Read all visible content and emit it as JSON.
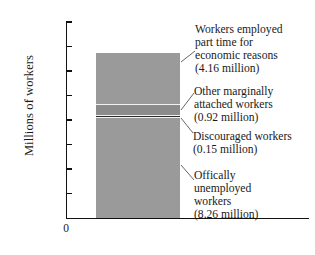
{
  "chart_data": {
    "type": "bar",
    "subtype": "stacked-single-bar",
    "title": "",
    "xlabel": "",
    "ylabel": "Millions of workers",
    "ylim": [
      0,
      16
    ],
    "yticks": [
      16,
      14,
      12,
      10,
      8,
      6,
      4,
      2
    ],
    "ytick_labels": [
      "16",
      "14",
      "12",
      "10",
      "8",
      "6",
      "4",
      "2"
    ],
    "origin_label": "0",
    "grid": false,
    "legend": false,
    "categories": [
      ""
    ],
    "total": 13.49,
    "units": "millions of workers",
    "series": [
      {
        "name": "Offically unemployed workers",
        "values": [
          8.26
        ],
        "value_label": "(8.26 million)",
        "color": "#9a9a9a",
        "order_from_bottom": 1
      },
      {
        "name": "Discouraged workers",
        "values": [
          0.15
        ],
        "value_label": "(0.15 million)",
        "color": "#2b2b2b",
        "order_from_bottom": 2
      },
      {
        "name": "Other marginally attached workers",
        "values": [
          0.92
        ],
        "value_label": "(0.92 million)",
        "color": "#8b8b8b",
        "order_from_bottom": 3
      },
      {
        "name": "Workers employed part time for economic reasons",
        "values": [
          4.16
        ],
        "value_label": "(4.16 million)",
        "color": "#9a9a9a",
        "order_from_bottom": 4
      }
    ],
    "annotations": [
      {
        "id": "part-time",
        "lines": [
          "Workers employed",
          "part time for",
          "economic reasons",
          "(4.16 million)"
        ]
      },
      {
        "id": "marginally-attached",
        "lines": [
          "Other marginally",
          "attached workers",
          "(0.92 million)"
        ]
      },
      {
        "id": "discouraged",
        "lines": [
          "Discouraged workers",
          "(0.15 million)"
        ]
      },
      {
        "id": "unemployed",
        "lines": [
          "Offically",
          "unemployed",
          "workers",
          "(8.26 million)"
        ]
      }
    ]
  },
  "axis": {
    "ylabel": "Millions of workers",
    "t16": "16",
    "t14": "14",
    "t12": "12",
    "t10": "10",
    "t8": "8",
    "t6": "6",
    "t4": "4",
    "t2": "2",
    "t0": "0"
  },
  "callouts": {
    "part_time": {
      "l1": "Workers employed",
      "l2": "part time for",
      "l3": "economic reasons",
      "l4": "(4.16 million)"
    },
    "marginally_attached": {
      "l1": "Other marginally",
      "l2": "attached workers",
      "l3": "(0.92 million)"
    },
    "discouraged": {
      "l1": "Discouraged workers",
      "l2": "(0.15 million)"
    },
    "unemployed": {
      "l1": "Offically",
      "l2": "unemployed",
      "l3": "workers",
      "l4": "(8.26 million)"
    }
  },
  "colors": {
    "axis": "#111111",
    "segment_light": "#9a9a9a",
    "segment_mid": "#8b8b8b",
    "segment_dark": "#2b2b2b",
    "separator": "#f2f2f2",
    "leader": "#555555",
    "background": "#ffffff"
  }
}
